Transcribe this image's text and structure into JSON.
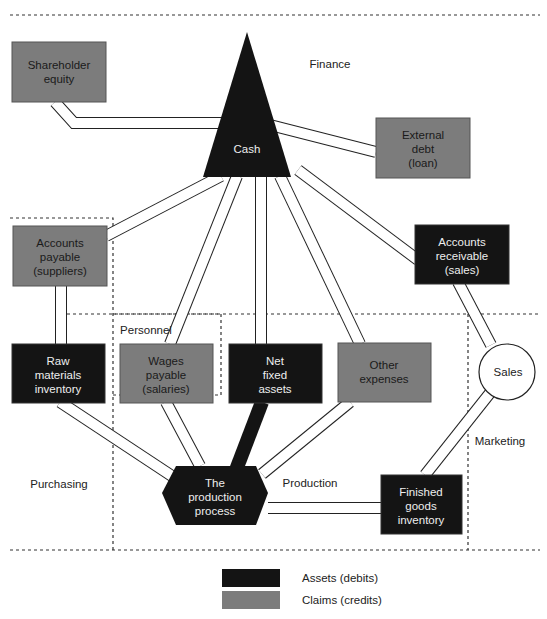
{
  "diagram": {
    "regions": {
      "finance": "Finance",
      "personnel": "Personnel",
      "purchasing": "Purchasing",
      "production": "Production",
      "marketing": "Marketing"
    },
    "nodes": {
      "shareholder_equity": {
        "line1": "Shareholder",
        "line2": "equity",
        "type": "claim"
      },
      "cash": {
        "label": "Cash",
        "type": "asset"
      },
      "external_debt": {
        "line1": "External",
        "line2": "debt",
        "line3": "(loan)",
        "type": "claim"
      },
      "accounts_payable": {
        "line1": "Accounts",
        "line2": "payable",
        "line3": "(suppliers)",
        "type": "claim"
      },
      "accounts_receivable": {
        "line1": "Accounts",
        "line2": "receivable",
        "line3": "(sales)",
        "type": "asset"
      },
      "raw_materials": {
        "line1": "Raw",
        "line2": "materials",
        "line3": "inventory",
        "type": "asset"
      },
      "wages_payable": {
        "line1": "Wages",
        "line2": "payable",
        "line3": "(salaries)",
        "type": "claim"
      },
      "net_fixed_assets": {
        "line1": "Net",
        "line2": "fixed",
        "line3": "assets",
        "type": "asset"
      },
      "other_expenses": {
        "line1": "Other",
        "line2": "expenses",
        "type": "claim"
      },
      "sales": {
        "label": "Sales"
      },
      "production_process": {
        "line1": "The",
        "line2": "production",
        "line3": "process",
        "type": "asset"
      },
      "finished_goods": {
        "line1": "Finished",
        "line2": "goods",
        "line3": "inventory",
        "type": "asset"
      }
    },
    "legend": [
      {
        "label": "Assets (debits)",
        "color": "#141414"
      },
      {
        "label": "Claims (credits)",
        "color": "#7c7c7c"
      }
    ],
    "colors": {
      "asset": "#141414",
      "claim": "#7c7c7c"
    }
  }
}
